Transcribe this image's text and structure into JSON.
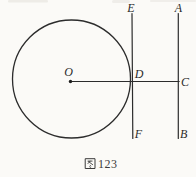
{
  "figure": {
    "caption": {
      "text": "图 123",
      "prefix": "图",
      "number": "123"
    },
    "points": {
      "center": "O",
      "tangent_point": "D",
      "foot_on_right_line": "C",
      "tangent_line_top": "E",
      "tangent_line_bottom": "F",
      "right_line_top": "A",
      "right_line_bottom": "B"
    },
    "colors": {
      "ink": "#2c2c2c",
      "paper": "#fbfaf7"
    }
  }
}
